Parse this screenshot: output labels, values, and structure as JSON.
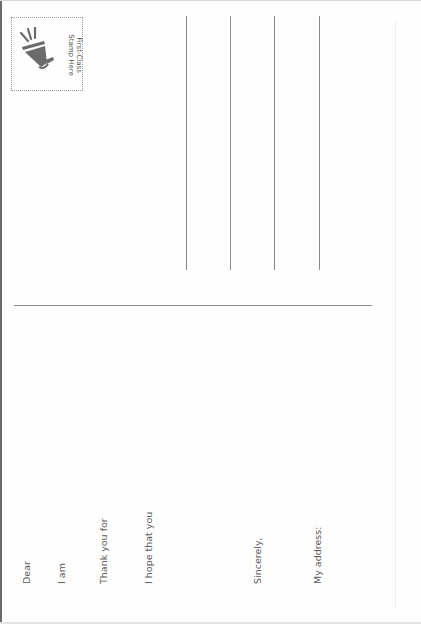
{
  "postcard": {
    "stamp": {
      "icon": "megaphone-icon",
      "line1": "First-Class",
      "line2": "Stamp Here"
    },
    "address_lines_count": 4,
    "prompts": {
      "dear": "Dear",
      "i_am": "I am",
      "thank_you_for": "Thank you for",
      "i_hope_that_you": "I hope that you",
      "sincerely": "Sincerely,",
      "my_address": "My address:"
    },
    "colors": {
      "text": "#5b5b5b",
      "lines": "#8a8a8a",
      "icon": "#6b6b6b",
      "background": "#ffffff"
    }
  }
}
